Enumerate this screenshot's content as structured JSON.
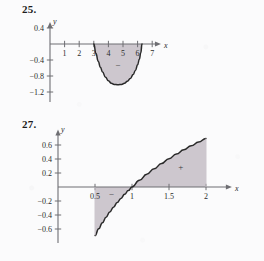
{
  "page": {
    "background_color": "#fbfbfc",
    "ink_color": "#1c1c1c",
    "fill_color": "#cdc7ce",
    "curve_color": "#2a2a2a",
    "axis_color": "#6e6e73"
  },
  "problems": [
    {
      "number": "25.",
      "chart_key": "chart_25"
    },
    {
      "number": "27.",
      "chart_key": "chart_27"
    }
  ],
  "chart_data": [
    {
      "id": "chart_25",
      "type": "area",
      "title": "",
      "xlabel": "x",
      "ylabel": "y",
      "xlim": [
        0,
        7.6
      ],
      "ylim": [
        -1.45,
        0.55
      ],
      "xticks": [
        1,
        2,
        3,
        4,
        5,
        6,
        7
      ],
      "xtick_labels": [
        "1",
        "2",
        "3",
        "4",
        "5",
        "6",
        "7"
      ],
      "yticks": [
        0.4,
        -0.4,
        -0.8,
        -1.2
      ],
      "ytick_labels": [
        "0.4",
        "-0.4",
        "-0.8",
        "-1.2"
      ],
      "grid": false,
      "legend": false,
      "shaded_region": {
        "x_start": 3.0,
        "x_end": 6.3,
        "sign": "-",
        "sign_label": "−",
        "sign_x": 4.65,
        "sign_y": -0.55
      },
      "series": [
        {
          "name": "curve",
          "x": [
            3.0,
            3.15,
            3.3,
            3.45,
            3.6,
            3.8,
            4.0,
            4.2,
            4.4,
            4.65,
            4.9,
            5.1,
            5.3,
            5.5,
            5.7,
            5.85,
            6.0,
            6.12,
            6.22,
            6.3
          ],
          "y": [
            0.0,
            -0.24,
            -0.43,
            -0.58,
            -0.7,
            -0.83,
            -0.92,
            -0.98,
            -1.01,
            -1.02,
            -1.01,
            -0.98,
            -0.93,
            -0.86,
            -0.76,
            -0.66,
            -0.52,
            -0.38,
            -0.22,
            0.0
          ]
        }
      ]
    },
    {
      "id": "chart_27",
      "type": "area",
      "title": "",
      "xlabel": "x",
      "ylabel": "y",
      "xlim": [
        0,
        2.35
      ],
      "ylim": [
        -0.8,
        0.82
      ],
      "xticks": [
        0.5,
        1,
        1.5,
        2
      ],
      "xtick_labels": [
        "0.5",
        "1",
        "1.5",
        "2"
      ],
      "yticks": [
        0.6,
        0.4,
        0.2,
        -0.2,
        -0.4,
        -0.6
      ],
      "ytick_labels": [
        "0.6",
        "0.4",
        "0.2",
        "-0.2",
        "-0.4",
        "-0.6"
      ],
      "grid": false,
      "legend": false,
      "shaded_regions": [
        {
          "x_start": 0.5,
          "x_end": 1.0,
          "sign": "-",
          "sign_label": "−",
          "sign_x": 0.72,
          "sign_y": -0.11
        },
        {
          "x_start": 1.0,
          "x_end": 2.0,
          "sign": "+",
          "sign_label": "+",
          "sign_x": 1.66,
          "sign_y": 0.27
        }
      ],
      "series": [
        {
          "name": "curve",
          "function": "ln(x)",
          "x": [
            0.5,
            0.55,
            0.6,
            0.65,
            0.7,
            0.75,
            0.8,
            0.85,
            0.9,
            0.95,
            1.0,
            1.1,
            1.2,
            1.3,
            1.4,
            1.5,
            1.6,
            1.7,
            1.8,
            1.9,
            2.0
          ],
          "y": [
            -0.693,
            -0.598,
            -0.511,
            -0.431,
            -0.357,
            -0.288,
            -0.223,
            -0.163,
            -0.105,
            -0.051,
            0.0,
            0.095,
            0.182,
            0.262,
            0.336,
            0.405,
            0.47,
            0.531,
            0.588,
            0.642,
            0.693
          ]
        }
      ]
    }
  ]
}
